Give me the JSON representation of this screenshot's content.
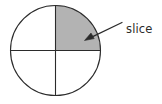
{
  "figure": {
    "type": "circle-quadrant-diagram",
    "background_color": "#ffffff",
    "circle": {
      "center_x": 55.5,
      "center_y": 50.5,
      "radius": 45,
      "stroke_color": "#2b2b2b",
      "stroke_width": 1.1,
      "fill_color": "#ffffff",
      "name": "circle-outline"
    },
    "diameters": [
      {
        "name": "vertical-diameter",
        "orientation": "vertical",
        "x1": 55.5,
        "y1": 5.5,
        "x2": 55.5,
        "y2": 95.5,
        "stroke_color": "#2b2b2b",
        "stroke_width": 1.1
      },
      {
        "name": "horizontal-diameter",
        "orientation": "horizontal",
        "x1": 10.5,
        "y1": 50.5,
        "x2": 100.5,
        "y2": 50.5,
        "stroke_color": "#2b2b2b",
        "stroke_width": 1.1
      }
    ],
    "shaded_sector": {
      "name": "shaded-quadrant",
      "position": "upper-right",
      "fraction_of_circle": 0.25,
      "start_angle_deg": 0,
      "end_angle_deg": 90,
      "fill_color": "#b3b3b3",
      "stroke_color": "#2b2b2b",
      "path": "M 55.5 50.5 L 100.5 50.5 A 45 45 0 0 0 55.5 5.5 Z"
    },
    "annotation": {
      "label": "slice",
      "label_x": 126,
      "label_y": 33,
      "text_color": "#2b2b2b",
      "font_size_px": 11.5,
      "arrow": {
        "name": "slice-pointer-arrow",
        "tail_x": 122,
        "tail_y": 22.5,
        "tip_x": 84.5,
        "tip_y": 40.5,
        "stroke_color": "#2b2b2b",
        "stroke_width": 1.2,
        "head_length": 9,
        "head_half_width": 3.4,
        "head_path": "M 84.5 40.5 L 94.2 38.6 L 91.0 33.0 Z"
      }
    }
  }
}
